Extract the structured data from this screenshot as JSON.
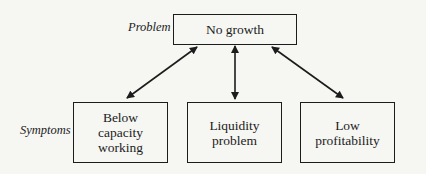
{
  "diagram": {
    "type": "hierarchy",
    "problem": {
      "label": "Problem",
      "box": {
        "text": "No growth"
      }
    },
    "symptoms": {
      "label": "Symptoms",
      "boxes": [
        {
          "text": "Below capacity working",
          "lines": [
            "Below",
            "capacity",
            "working"
          ]
        },
        {
          "text": "Liquidity problem",
          "lines": [
            "Liquidity",
            "problem"
          ]
        },
        {
          "text": "Low profitability",
          "lines": [
            "Low",
            "profitability"
          ]
        }
      ]
    },
    "connections": [
      {
        "from": "No growth",
        "to": "Below capacity working",
        "style": "double-headed arrow"
      },
      {
        "from": "No growth",
        "to": "Liquidity problem",
        "style": "double-headed arrow"
      },
      {
        "from": "No growth",
        "to": "Low profitability",
        "style": "double-headed arrow"
      }
    ]
  }
}
